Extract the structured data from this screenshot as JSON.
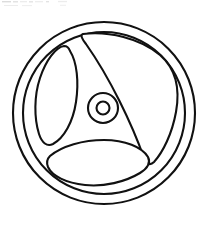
{
  "document": {
    "title": "Wheel Line Drawing",
    "description": "Black outline line-art illustration of a three-spoke wheel on a plain white background",
    "style": "coloring-book line art",
    "canvas": {
      "width": 208,
      "height": 226,
      "background_color": "#ffffff"
    }
  },
  "artwork": {
    "name": "three-spoke-wheel",
    "line_color": "#111111",
    "fill_color": "#ffffff",
    "stroke_width": 2.1,
    "parts": [
      {
        "id": "outer-rim",
        "label": "Outer rim circle",
        "shape": "circle",
        "center_x": 104,
        "center_y": 113,
        "radius": 91
      },
      {
        "id": "inner-rim",
        "label": "Inner rim circle",
        "shape": "circle",
        "center_x": 104,
        "center_y": 113,
        "radius": 81
      },
      {
        "id": "hub-outer",
        "label": "Hub outer circle",
        "shape": "circle",
        "center_x": 103,
        "center_y": 108,
        "radius": 15
      },
      {
        "id": "hub-inner",
        "label": "Hub inner circle",
        "shape": "circle",
        "center_x": 103,
        "center_y": 108,
        "radius": 6.5
      },
      {
        "id": "opening-right",
        "label": "Large right sail-shaped opening",
        "shape": "curved-triangle",
        "position": "upper-right"
      },
      {
        "id": "opening-left",
        "label": "Left leaf-shaped opening",
        "shape": "lens",
        "position": "upper-left"
      },
      {
        "id": "opening-bottom",
        "label": "Bottom eye-shaped opening",
        "shape": "lens",
        "position": "bottom-center"
      }
    ],
    "spoke_count": 3
  },
  "header_artifact": {
    "label": "faint gray scan artifact",
    "color": "#dcdcdc",
    "visible": true
  }
}
